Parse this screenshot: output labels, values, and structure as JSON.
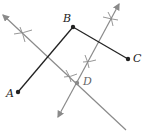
{
  "diagram": {
    "points": [
      {
        "name": "A",
        "x": 18,
        "y": 92
      },
      {
        "name": "B",
        "x": 73,
        "y": 27
      },
      {
        "name": "C",
        "x": 128,
        "y": 59
      },
      {
        "name": "D",
        "x": 76,
        "y": 83
      }
    ],
    "labels": {
      "A": "A",
      "B": "B",
      "C": "C",
      "D": "D"
    },
    "segments": [
      "AB",
      "BC"
    ],
    "bisectors": [
      "perpendicular bisector of AB",
      "perpendicular bisector of BC"
    ],
    "colors": {
      "segment": "#222222",
      "bisector": "#8a8a8a",
      "point": "#222222"
    }
  }
}
